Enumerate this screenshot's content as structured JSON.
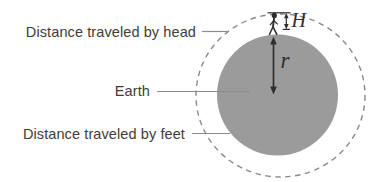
{
  "diagram": {
    "type": "annotated-geometry-figure",
    "description_visible_elements": "Gray filled circle (Earth) inside a larger dashed circle (path of head), small walking person on top, vertical measurement arrows",
    "labels": {
      "head": "Distance traveled by head",
      "earth": "Earth",
      "feet": "Distance traveled by feet"
    },
    "variables": {
      "person_height": "H",
      "earth_radius": "r"
    },
    "colors": {
      "background": "#ffffff",
      "earth_fill": "#9b9b9b",
      "dashed_stroke": "#8a8a8a",
      "leader_line": "#8c8c8c",
      "text": "#3d3d3d",
      "ink": "#2e2e2e"
    }
  }
}
